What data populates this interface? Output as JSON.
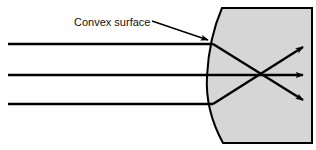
{
  "figure": {
    "type": "optics-ray-diagram",
    "background_color": "#ffffff"
  },
  "annotations": {
    "convex_surface_label": "Convex surface",
    "label_position": {
      "x": 74,
      "y": 22
    },
    "pointer_arrow": {
      "name": "label-pointer-arrow",
      "from": {
        "x": 152,
        "y": 21
      },
      "to": {
        "x": 211,
        "y": 41
      }
    }
  },
  "medium": {
    "name": "glass-block",
    "fill_color": "#d6d6d6",
    "stroke_color": "#000000",
    "stroke_width": 2,
    "geometry": {
      "top_left_vertex": {
        "x": 222,
        "y": 8
      },
      "top_right_vertex": {
        "x": 312,
        "y": 8
      },
      "bottom_right_vertex": {
        "x": 312,
        "y": 143
      },
      "bottom_left_vertex": {
        "x": 223,
        "y": 143
      },
      "arc_apex": {
        "x": 207,
        "y": 76
      },
      "arc_description": "convex curved left face bulging toward incoming rays"
    }
  },
  "incident_rays": [
    {
      "name": "incident-ray-top",
      "y": 44,
      "x_start": 8,
      "x_end": 213
    },
    {
      "name": "incident-ray-middle",
      "y": 75,
      "x_start": 8,
      "x_end": 208
    },
    {
      "name": "incident-ray-bottom",
      "y": 104,
      "x_start": 8,
      "x_end": 213
    }
  ],
  "refracted_rays": [
    {
      "name": "refracted-ray-top",
      "from": {
        "x": 213,
        "y": 44
      },
      "to": {
        "x": 305,
        "y": 101
      },
      "arrowhead": true
    },
    {
      "name": "refracted-ray-middle",
      "from": {
        "x": 208,
        "y": 75
      },
      "to": {
        "x": 307,
        "y": 75
      },
      "arrowhead": true
    },
    {
      "name": "refracted-ray-bottom",
      "from": {
        "x": 213,
        "y": 104
      },
      "to": {
        "x": 305,
        "y": 46
      },
      "arrowhead": true
    }
  ],
  "focal_point": {
    "x": 260,
    "y": 75,
    "visible": false
  },
  "style": {
    "ray_color": "#000000",
    "ray_width": 2.4,
    "label_font_size": 11,
    "label_color": "#111111"
  }
}
